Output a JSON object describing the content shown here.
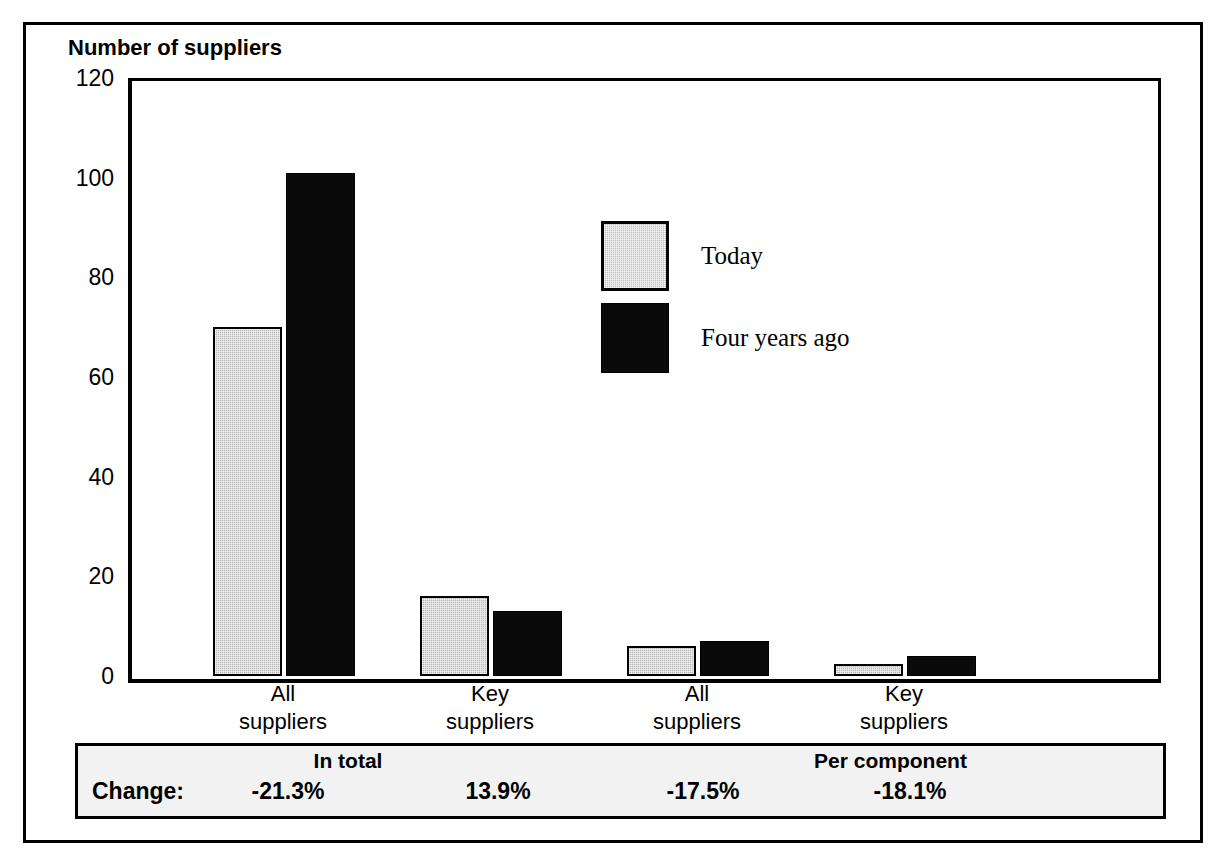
{
  "chart_data": {
    "type": "bar",
    "title": "Number of suppliers",
    "xlabel": "",
    "ylabel": "Number of suppliers",
    "ylim": [
      0,
      120
    ],
    "yticks": [
      "0",
      "20",
      "40",
      "60",
      "80",
      "100",
      "120"
    ],
    "ytick_values": [
      0,
      20,
      40,
      60,
      80,
      100,
      120
    ],
    "grid": false,
    "legend_position": "inside-upper-center",
    "categories": [
      "All suppliers",
      "Key suppliers",
      "All suppliers",
      "Key suppliers"
    ],
    "category_lines": [
      [
        "All",
        "suppliers"
      ],
      [
        "Key",
        "suppliers"
      ],
      [
        "All",
        "suppliers"
      ],
      [
        "Key",
        "suppliers"
      ]
    ],
    "groups": [
      "In total",
      "In total",
      "Per component",
      "Per component"
    ],
    "series": [
      {
        "name": "Today",
        "color": "#b8b8b8",
        "values": [
          70,
          16,
          6,
          2.5
        ]
      },
      {
        "name": "Four years ago",
        "color": "#0a0a0a",
        "values": [
          101,
          13,
          7,
          4
        ]
      }
    ],
    "annotations": {
      "change_row_label": "Change:",
      "change_values": [
        "-21.3%",
        "13.9%",
        "-17.5%",
        "-18.1%"
      ],
      "group_headers": [
        "In total",
        "Per component"
      ]
    }
  },
  "chart": {
    "title": "Number of suppliers"
  },
  "y_axis": {
    "ticks": [
      {
        "label": "120",
        "value": 120
      },
      {
        "label": "100",
        "value": 100
      },
      {
        "label": "80",
        "value": 80
      },
      {
        "label": "60",
        "value": 60
      },
      {
        "label": "40",
        "value": 40
      },
      {
        "label": "20",
        "value": 20
      },
      {
        "label": "0",
        "value": 0
      }
    ]
  },
  "legend": {
    "items": [
      {
        "label": "Today",
        "color": "#b8b8b8"
      },
      {
        "label": "Four years ago",
        "color": "#0a0a0a"
      }
    ]
  },
  "x_axis": {
    "labels": [
      {
        "line1": "All",
        "line2": "suppliers"
      },
      {
        "line1": "Key",
        "line2": "suppliers"
      },
      {
        "line1": "All",
        "line2": "suppliers"
      },
      {
        "line1": "Key",
        "line2": "suppliers"
      }
    ]
  },
  "change_table": {
    "headers": [
      {
        "text": "In total"
      },
      {
        "text": "Per component"
      }
    ],
    "row_label": "Change:",
    "values": [
      {
        "text": "-21.3%"
      },
      {
        "text": "13.9%"
      },
      {
        "text": "-17.5%"
      },
      {
        "text": "-18.1%"
      }
    ]
  }
}
